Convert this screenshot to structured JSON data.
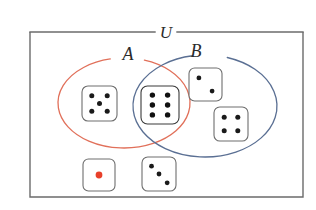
{
  "figure": {
    "type": "venn-diagram",
    "background_color": "#ffffff"
  },
  "universe": {
    "label": "U",
    "label_font_size": 17,
    "border_color": "#6b6b6b",
    "border_width": 1.4,
    "x": 30,
    "y": 32,
    "width": 273,
    "height": 165,
    "label_x": 166,
    "label_y": 32
  },
  "sets": [
    {
      "id": "A",
      "label": "A",
      "color": "#e1705a",
      "stroke_width": 1.3,
      "cx": 124,
      "cy": 103,
      "rx": 66,
      "ry": 45,
      "label_x": 128,
      "label_y": 60,
      "label_font_size": 18,
      "gap_start_deg": 258,
      "gap_end_deg": 288
    },
    {
      "id": "B",
      "label": "B",
      "color": "#5a6f93",
      "stroke_width": 1.3,
      "cx": 205,
      "cy": 106,
      "rx": 72,
      "ry": 51,
      "label_x": 196,
      "label_y": 57,
      "label_font_size": 18,
      "gap_start_deg": 260,
      "gap_end_deg": 288
    }
  ],
  "dice": [
    {
      "id": "die-five",
      "value": 5,
      "region": "A-only",
      "x": 82,
      "y": 86,
      "size": 35,
      "face_color": "#ffffff",
      "border_color": "#6e6e6e",
      "pip_color": "#1a1a1a",
      "pip_radius": 2.5
    },
    {
      "id": "die-six",
      "value": 6,
      "region": "A-and-B",
      "x": 141,
      "y": 86,
      "size": 38,
      "face_color": "#ffffff",
      "border_color": "#3a3a3a",
      "pip_color": "#111111",
      "pip_radius": 2.7
    },
    {
      "id": "die-two",
      "value": 2,
      "region": "B-only",
      "x": 189,
      "y": 68,
      "size": 33,
      "face_color": "#ffffff",
      "border_color": "#6e6e6e",
      "pip_color": "#1a1a1a",
      "pip_radius": 2.4
    },
    {
      "id": "die-four",
      "value": 4,
      "region": "B-only",
      "x": 214,
      "y": 107,
      "size": 34,
      "face_color": "#ffffff",
      "border_color": "#6e6e6e",
      "pip_color": "#1a1a1a",
      "pip_radius": 2.5
    },
    {
      "id": "die-one",
      "value": 1,
      "region": "outside",
      "x": 83,
      "y": 159,
      "size": 32,
      "face_color": "#ffffff",
      "border_color": "#6e6e6e",
      "pip_color": "#e8402a",
      "pip_radius": 3.4
    },
    {
      "id": "die-three",
      "value": 3,
      "region": "outside",
      "x": 142,
      "y": 157,
      "size": 34,
      "face_color": "#ffffff",
      "border_color": "#6e6e6e",
      "pip_color": "#1a1a1a",
      "pip_radius": 2.4
    }
  ],
  "pip_layouts": {
    "1": [
      [
        0.5,
        0.5
      ]
    ],
    "2": [
      [
        0.3,
        0.3
      ],
      [
        0.7,
        0.7
      ]
    ],
    "3": [
      [
        0.28,
        0.27
      ],
      [
        0.5,
        0.5
      ],
      [
        0.74,
        0.76
      ]
    ],
    "4": [
      [
        0.3,
        0.3
      ],
      [
        0.7,
        0.3
      ],
      [
        0.3,
        0.7
      ],
      [
        0.7,
        0.7
      ]
    ],
    "5": [
      [
        0.28,
        0.28
      ],
      [
        0.72,
        0.28
      ],
      [
        0.5,
        0.5
      ],
      [
        0.28,
        0.72
      ],
      [
        0.72,
        0.72
      ]
    ],
    "6": [
      [
        0.3,
        0.24
      ],
      [
        0.7,
        0.24
      ],
      [
        0.3,
        0.5
      ],
      [
        0.7,
        0.5
      ],
      [
        0.3,
        0.76
      ],
      [
        0.7,
        0.76
      ]
    ]
  }
}
